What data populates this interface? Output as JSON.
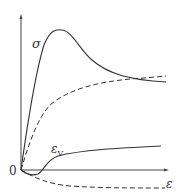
{
  "diagram": {
    "type": "line",
    "axes": {
      "x_label": "ε",
      "y_label": "",
      "origin_label": "0"
    },
    "curves": [
      {
        "name": "stress",
        "label": "σ",
        "style": "solid"
      },
      {
        "name": "stress-dashed",
        "label": "",
        "style": "dashed"
      },
      {
        "name": "volumetric-strain",
        "label": "εV",
        "label_main": "ε",
        "label_sub": "V",
        "style": "solid"
      },
      {
        "name": "volumetric-strain-dashed",
        "label": "",
        "style": "dashed"
      }
    ],
    "colors": {
      "line": "#333333",
      "background": "#ffffff"
    }
  }
}
